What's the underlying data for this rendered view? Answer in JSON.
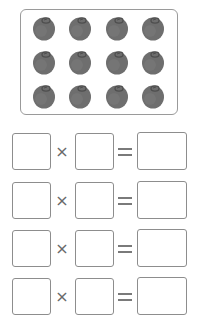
{
  "picture": {
    "rows": 3,
    "cols": 4,
    "item": "fruit-icon",
    "fruit_color": "#6e6e6e",
    "fruit_dark": "#4e4e4e",
    "frame_border": "#9a9a9a",
    "col_centers": [
      44,
      80,
      117,
      153
    ],
    "row_centers": [
      28,
      62,
      96
    ]
  },
  "equations": [
    {
      "factor1": "",
      "operator": "×",
      "factor2": "",
      "equals": "=",
      "product": ""
    },
    {
      "factor1": "",
      "operator": "×",
      "factor2": "",
      "equals": "=",
      "product": ""
    },
    {
      "factor1": "",
      "operator": "×",
      "factor2": "",
      "equals": "=",
      "product": ""
    },
    {
      "factor1": "",
      "operator": "×",
      "factor2": "",
      "equals": "=",
      "product": ""
    }
  ],
  "layout": {
    "row_tops": [
      133,
      182,
      230,
      278
    ]
  }
}
